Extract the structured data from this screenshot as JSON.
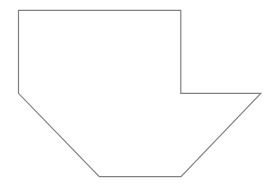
{
  "diagram": {
    "type": "polygon-outline",
    "canvas": {
      "width": 272,
      "height": 187,
      "background": "#ffffff"
    },
    "shape": {
      "name": "heptagon-notched",
      "stroke": "#808080",
      "stroke_width": 1.2,
      "fill": "none",
      "vertices": [
        [
          18.5,
          10.3
        ],
        [
          180.8,
          10.3
        ],
        [
          180.8,
          93.3
        ],
        [
          260.8,
          93.3
        ],
        [
          181.0,
          176.7
        ],
        [
          99.3,
          176.7
        ],
        [
          18.5,
          93.3
        ]
      ]
    }
  }
}
